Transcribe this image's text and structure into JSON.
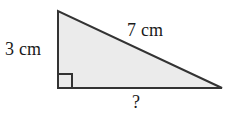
{
  "figure": {
    "type": "right-triangle-diagram",
    "background_color": "#ffffff",
    "shape": {
      "name": "right-triangle",
      "fill_color": "#ebebeb",
      "stroke_color": "#333333",
      "stroke_width": 2,
      "vertices": {
        "apex_top_left": [
          58,
          11
        ],
        "corner_bottom_left": [
          58,
          88
        ],
        "corner_bottom_right": [
          222,
          88
        ]
      }
    },
    "right_angle_marker": {
      "name": "right-angle-square",
      "corner": [
        58,
        88
      ],
      "size": 14,
      "stroke_color": "#333333",
      "stroke_width": 2
    },
    "labels": {
      "vertical_leg": "3 cm",
      "hypotenuse": "7 cm",
      "base_unknown": "?"
    }
  }
}
